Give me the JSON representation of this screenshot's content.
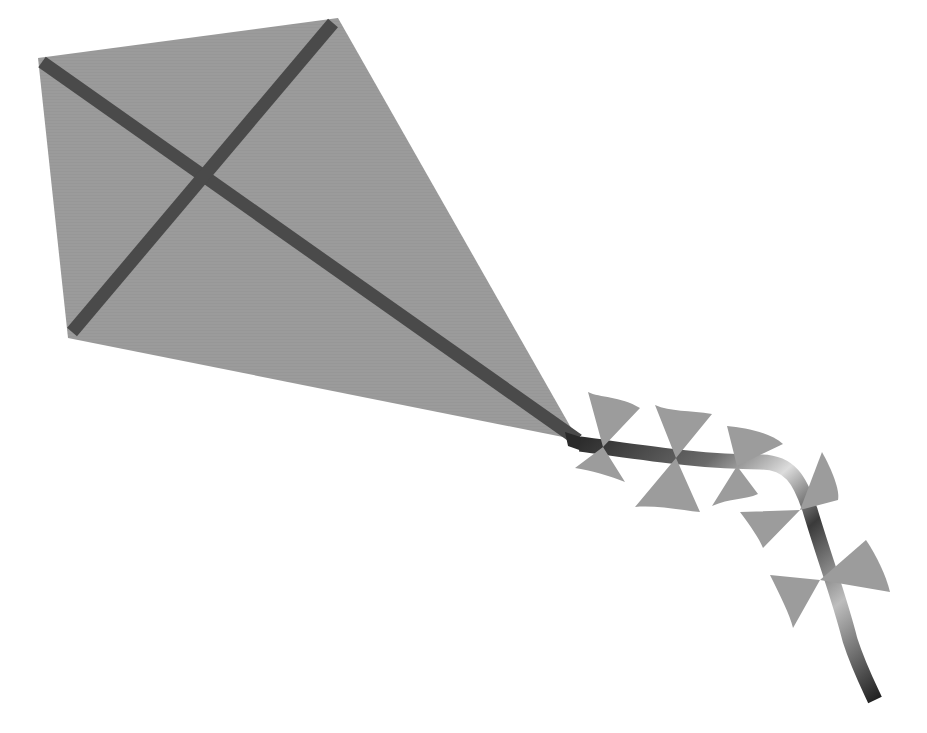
{
  "image": {
    "description": "Gray paper kite with dark crossed spars and a ribbon tail with five bows",
    "colors": {
      "background": "#ffffff",
      "kite_body": "#9a9a9a",
      "spars": "#4a4a4a",
      "bows": "#9c9c9c",
      "ribbon_dark": "#3a3a3a",
      "ribbon_light": "#d8d8d8"
    },
    "objects": [
      {
        "name": "kite-body",
        "shape": "quadrilateral"
      },
      {
        "name": "spar-long",
        "shape": "bar"
      },
      {
        "name": "spar-cross",
        "shape": "bar"
      },
      {
        "name": "tail-ribbon",
        "shape": "curved-strip"
      },
      {
        "name": "bow",
        "count": 5
      }
    ]
  }
}
